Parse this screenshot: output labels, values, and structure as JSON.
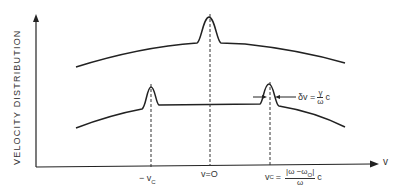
{
  "axes": {
    "y_label": "VELOCITY DISTRIBUTION",
    "x_label": "v"
  },
  "ticks": {
    "neg_vc": {
      "prefix": "− v",
      "sub": "C"
    },
    "zero": "v=O",
    "pos_vc": {
      "lhs": "v",
      "sub": "C",
      "eq": "=",
      "num": "|ω −ω",
      "num_sub": "O",
      "num_end": "|",
      "den": "ω",
      "suffix": "c"
    }
  },
  "annotation": {
    "lhs": "δv =",
    "num": "γ",
    "den": "ω",
    "suffix": "c"
  },
  "colors": {
    "line": "#222222",
    "background": "#ffffff"
  }
}
